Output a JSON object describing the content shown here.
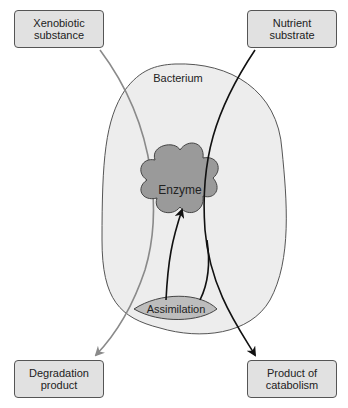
{
  "diagram": {
    "container_label": "Bacterium",
    "center_node": "Enzyme",
    "assimilation_label": "Assimilation",
    "inputs": [
      {
        "label_line1": "Xenobiotic",
        "label_line2": "substance"
      },
      {
        "label_line1": "Nutrient",
        "label_line2": "substrate"
      }
    ],
    "outputs": [
      {
        "label_line1": "Degradation",
        "label_line2": "product"
      },
      {
        "label_line1": "Product of",
        "label_line2": "catabolism"
      }
    ],
    "colors": {
      "box_fill": "#e1e1e1",
      "cell_fill": "#ededed",
      "enzyme_fill": "#9a9a9a",
      "xenobiotic_path": "#8a8a8a",
      "nutrient_path": "#111111"
    }
  }
}
